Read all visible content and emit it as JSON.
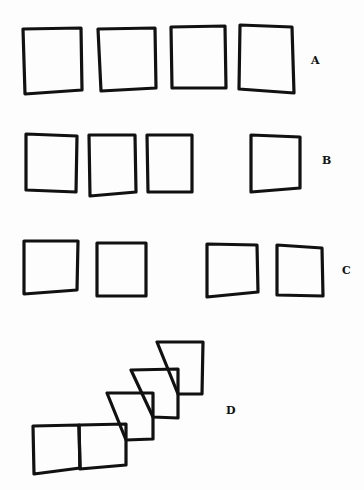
{
  "diagram": {
    "rows": [
      {
        "label": "A",
        "label_pos": [
          311,
          54
        ],
        "squares": [
          {
            "points": "23,29 81,28 82,90 25,94"
          },
          {
            "points": "98,29 155,28 156,88 101,91"
          },
          {
            "points": "171,27 225,26 226,88 172,88"
          },
          {
            "points": "240,25 292,27 294,93 239,89"
          }
        ]
      },
      {
        "label": "B",
        "label_pos": [
          322,
          154
        ],
        "squares": [
          {
            "points": "26,134 77,136 76,192 26,190"
          },
          {
            "points": "89,135 135,135 136,192 90,196"
          },
          {
            "points": "147,135 192,135 192,192 148,192"
          },
          {
            "points": "251,135 300,137 300,188 251,192"
          }
        ]
      },
      {
        "label": "C",
        "label_pos": [
          342,
          264
        ],
        "squares": [
          {
            "points": "24,241 78,241 77,290 24,294"
          },
          {
            "points": "97,243 146,243 146,296 97,296"
          },
          {
            "points": "207,244 257,245 258,292 207,297"
          },
          {
            "points": "277,245 322,248 323,296 277,295"
          }
        ]
      },
      {
        "label": "D",
        "label_pos": [
          226,
          404
        ],
        "squares": [
          {
            "points": "33,426 79,425 80,468 34,474"
          },
          {
            "points": "79,425 126,424 126,465 80,469"
          },
          {
            "points": "107,393 153,393 153,439 126,440"
          },
          {
            "points": "131,370 178,369 178,418 153,417"
          },
          {
            "points": "157,342 203,342 202,394 178,394"
          }
        ]
      }
    ]
  }
}
